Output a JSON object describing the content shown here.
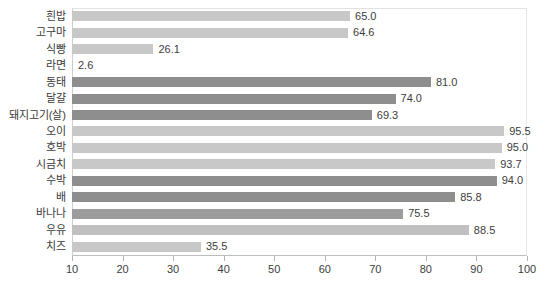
{
  "chart_data": {
    "type": "bar",
    "orientation": "horizontal",
    "title": "",
    "subtitle": "",
    "xlabel": "",
    "ylabel": "",
    "xlim": [
      10,
      100
    ],
    "xticks": [
      10,
      20,
      30,
      40,
      50,
      60,
      70,
      80,
      90,
      100
    ],
    "grid": false,
    "legend": "none",
    "categories": [
      "흰밥",
      "고구마",
      "식빵",
      "라면",
      "동태",
      "달걀",
      "돼지고기(살)",
      "오이",
      "호박",
      "시금치",
      "수박",
      "배",
      "바나나",
      "우유",
      "치즈"
    ],
    "values": [
      65.0,
      64.6,
      26.1,
      2.6,
      81.0,
      74.0,
      69.3,
      95.5,
      95.0,
      93.7,
      94.0,
      85.8,
      75.5,
      88.5,
      35.5
    ],
    "data_labels": [
      "65.0",
      "64.6",
      "26.1",
      "2.6",
      "81.0",
      "74.0",
      "69.3",
      "95.5",
      "95.0",
      "93.7",
      "94.0",
      "85.8",
      "75.5",
      "88.5",
      "35.5"
    ],
    "bar_colors": [
      "#c8c8c8",
      "#c8c8c8",
      "#c8c8c8",
      "#c8c8c8",
      "#8e8e8e",
      "#8e8e8e",
      "#8e8e8e",
      "#c8c8c8",
      "#c8c8c8",
      "#c8c8c8",
      "#8e8e8e",
      "#8e8e8e",
      "#9c9c9c",
      "#c0c0c0",
      "#c8c8c8"
    ]
  },
  "colors": {
    "light_bar": "#c8c8c8",
    "dark_bar": "#8e8e8e",
    "axis_line": "#bdbdbd",
    "text": "#3d3d3d",
    "background": "#ffffff"
  }
}
